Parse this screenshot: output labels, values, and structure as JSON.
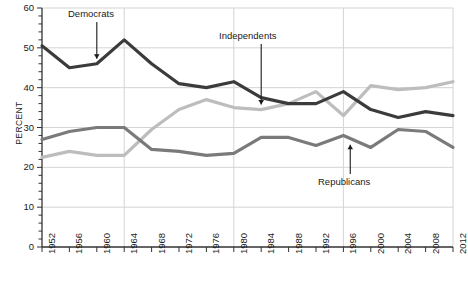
{
  "chart_data": {
    "type": "line",
    "title": "",
    "xlabel": "",
    "ylabel": "PERCENT",
    "xlim": [
      1952,
      2012
    ],
    "ylim": [
      0,
      60
    ],
    "ytick_step": 10,
    "minor_ytick_step": 2,
    "grid": true,
    "legend_position": "inline-annotations",
    "x": [
      1952,
      1956,
      1960,
      1964,
      1968,
      1972,
      1976,
      1980,
      1984,
      1988,
      1992,
      1996,
      2000,
      2004,
      2008,
      2012
    ],
    "categories": [
      "1952",
      "1956",
      "1960",
      "1964",
      "1968",
      "1972",
      "1976",
      "1980",
      "1984",
      "1988",
      "1992",
      "1996",
      "2000",
      "2004",
      "2008",
      "2012"
    ],
    "ytick_labels": [
      "0",
      "10",
      "20",
      "30",
      "40",
      "50",
      "60"
    ],
    "ytick_values": [
      0,
      10,
      20,
      30,
      40,
      50,
      60
    ],
    "series": [
      {
        "name": "Democrats",
        "color": "#3b3b3b",
        "values": [
          50.5,
          45.0,
          46.0,
          52.0,
          46.0,
          41.0,
          40.0,
          41.5,
          37.5,
          36.0,
          36.0,
          39.0,
          34.5,
          32.5,
          34.0,
          33.0
        ]
      },
      {
        "name": "Independents",
        "color": "#bdbdbd",
        "values": [
          22.5,
          24.0,
          23.0,
          23.0,
          29.5,
          34.5,
          37.0,
          35.0,
          34.5,
          36.0,
          39.0,
          33.0,
          40.5,
          39.5,
          40.0,
          41.5
        ]
      },
      {
        "name": "Republicans",
        "color": "#7a7a7a",
        "values": [
          27.0,
          29.0,
          30.0,
          30.0,
          24.5,
          24.0,
          23.0,
          23.5,
          27.5,
          27.5,
          25.5,
          28.0,
          25.0,
          29.5,
          29.0,
          25.0
        ]
      }
    ],
    "annotations": [
      {
        "label": "Democrats",
        "target_x": 1960,
        "target_y": 46.0
      },
      {
        "label": "Independents",
        "target_x": 1984,
        "target_y": 34.5
      },
      {
        "label": "Republicans",
        "target_x": 1997,
        "target_y": 27.0
      }
    ]
  }
}
